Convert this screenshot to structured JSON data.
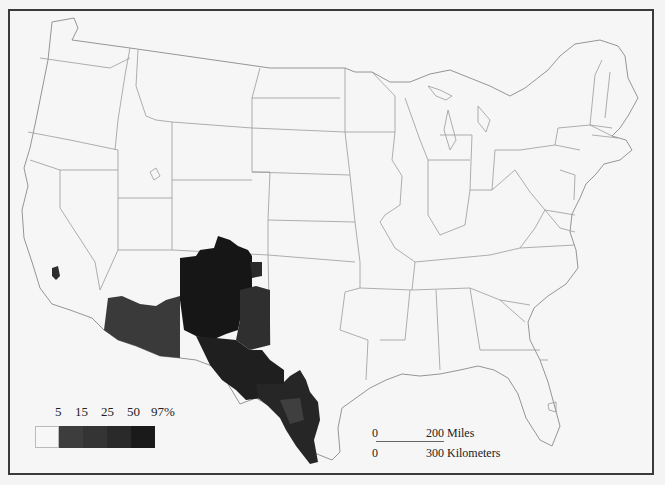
{
  "map": {
    "subject": "United States (contiguous) county choropleth",
    "highlighted_region": "Southwestern border counties (Arizona, New Mexico, Texas, southern California, southern Colorado)",
    "colors": {
      "background": "#f6f6f6",
      "frame": "#3a3a3a",
      "boundary": "#9a9a9a",
      "class_1": "#f7f7f7",
      "class_2": "#3d3d3d",
      "class_3": "#343434",
      "class_4": "#2a2a2a",
      "class_5": "#1a1a1a"
    }
  },
  "legend": {
    "labels": [
      "5",
      "15",
      "25",
      "50",
      "97%"
    ],
    "classes": [
      {
        "range": "< 5",
        "color": "#f7f7f7"
      },
      {
        "range": "5–15",
        "color": "#3d3d3d"
      },
      {
        "range": "15–25",
        "color": "#343434"
      },
      {
        "range": "25–50",
        "color": "#2a2a2a"
      },
      {
        "range": "50–97%",
        "color": "#1a1a1a"
      }
    ]
  },
  "scale_bar": {
    "miles_zero": "0",
    "miles_label": "200 Miles",
    "km_zero": "0",
    "km_label": "300 Kilometers"
  }
}
